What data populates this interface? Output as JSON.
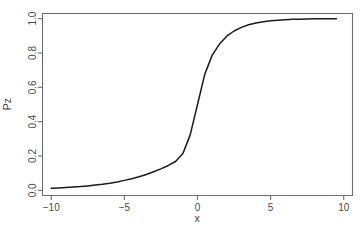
{
  "chart_data": {
    "type": "line",
    "title": "",
    "subtitle": "",
    "xlabel": "x",
    "ylabel": "Pz",
    "xlim": [
      -10.6,
      10.6
    ],
    "ylim": [
      -0.03,
      1.03
    ],
    "grid": false,
    "legend": null,
    "x_ticks": [
      -10,
      -5,
      0,
      5,
      10
    ],
    "x_tick_labels": [
      "−10",
      "−5",
      "0",
      "5",
      "10"
    ],
    "y_ticks": [
      0.0,
      0.2,
      0.4,
      0.6,
      0.8,
      1.0
    ],
    "y_tick_labels": [
      "0.0",
      "0.2",
      "0.4",
      "0.6",
      "0.8",
      "1.0"
    ],
    "series": [
      {
        "name": "Pz",
        "color": "#1b1b1b",
        "formula": "logistic",
        "x": [
          -10.0,
          -9.5,
          -9.0,
          -8.5,
          -8.0,
          -7.5,
          -7.0,
          -6.5,
          -6.0,
          -5.5,
          -5.0,
          -4.5,
          -4.0,
          -3.5,
          -3.0,
          -2.5,
          -2.0,
          -1.5,
          -1.0,
          -0.5,
          0.0,
          0.5,
          1.0,
          1.5,
          2.0,
          2.5,
          3.0,
          3.5,
          4.0,
          4.5,
          5.0,
          5.5,
          6.0,
          6.5,
          7.0,
          7.5,
          8.0,
          8.5,
          9.0,
          9.5
        ],
        "values": [
          0.012,
          0.014,
          0.016,
          0.019,
          0.022,
          0.026,
          0.031,
          0.036,
          0.042,
          0.049,
          0.058,
          0.068,
          0.079,
          0.092,
          0.108,
          0.125,
          0.145,
          0.168,
          0.214,
          0.323,
          0.5,
          0.677,
          0.786,
          0.852,
          0.898,
          0.928,
          0.949,
          0.964,
          0.975,
          0.982,
          0.988,
          0.991,
          0.994,
          0.996,
          0.997,
          0.998,
          0.999,
          0.999,
          1.0,
          1.0
        ]
      }
    ]
  },
  "axes": {
    "x_title": "x",
    "y_title": "Pz"
  },
  "colors": {
    "background": "#ffffff",
    "curve": "#1b1b1b",
    "frame": "#6e6e6e",
    "text": "#4a4a4a"
  }
}
